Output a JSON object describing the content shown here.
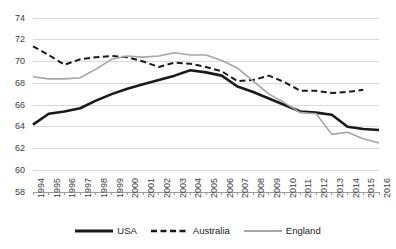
{
  "chart_data": {
    "type": "line",
    "title": "",
    "xlabel": "",
    "ylabel": "",
    "x": [
      1994,
      1995,
      1996,
      1997,
      1998,
      1999,
      2000,
      2001,
      2002,
      2003,
      2004,
      2005,
      2006,
      2007,
      2008,
      2009,
      2010,
      2011,
      2012,
      2013,
      2014,
      2015,
      2016
    ],
    "xtick_labels": [
      "1994",
      "1995",
      "1996",
      "1997",
      "1998",
      "1999",
      "2000",
      "2001",
      "2002",
      "2003",
      "2004",
      "2005",
      "2006",
      "2007",
      "2008",
      "2009",
      "2010",
      "2011",
      "2012",
      "2013",
      "2014",
      "2015",
      "2016"
    ],
    "ytick_labels": [
      "58",
      "60",
      "62",
      "64",
      "66",
      "68",
      "70",
      "72",
      "74"
    ],
    "yticks": [
      58,
      60,
      62,
      64,
      66,
      68,
      70,
      72,
      74
    ],
    "ylim": [
      58,
      74
    ],
    "xlim": [
      1994,
      2016
    ],
    "grid": "horizontal",
    "legend_position": "bottom",
    "series": [
      {
        "name": "USA",
        "color": "#1a1a1a",
        "style": "solid",
        "width": 2.6,
        "values": [
          64.2,
          65.2,
          65.4,
          65.7,
          66.4,
          67.0,
          67.5,
          67.9,
          68.3,
          68.7,
          69.2,
          69.0,
          68.7,
          67.7,
          67.2,
          66.6,
          66.0,
          65.4,
          65.3,
          65.1,
          64.0,
          63.8,
          63.7
        ]
      },
      {
        "name": "Australia",
        "color": "#1a1a1a",
        "style": "dashed",
        "width": 2.0,
        "values": [
          71.4,
          70.6,
          69.7,
          70.2,
          70.4,
          70.5,
          70.4,
          70.0,
          69.5,
          69.9,
          69.8,
          69.5,
          69.1,
          68.2,
          68.3,
          68.7,
          68.1,
          67.3,
          67.3,
          67.1,
          67.2,
          67.4,
          null
        ]
      },
      {
        "name": "England",
        "color": "#a6a6a6",
        "style": "solid",
        "width": 1.6,
        "values": [
          68.6,
          68.4,
          68.4,
          68.5,
          69.3,
          70.2,
          70.5,
          70.4,
          70.5,
          70.8,
          70.6,
          70.6,
          70.1,
          69.4,
          68.2,
          67.0,
          66.2,
          65.3,
          65.2,
          63.3,
          63.5,
          62.9,
          62.5
        ]
      }
    ]
  },
  "legend": {
    "items": [
      {
        "label": "USA",
        "key": "usa"
      },
      {
        "label": "Australia",
        "key": "australia"
      },
      {
        "label": "England",
        "key": "england"
      }
    ]
  },
  "colors": {
    "usa": "#1a1a1a",
    "australia": "#1a1a1a",
    "england": "#a6a6a6",
    "grid": "#d9d9d9",
    "axis": "#9c9c9c",
    "text": "#3c3c3c"
  }
}
